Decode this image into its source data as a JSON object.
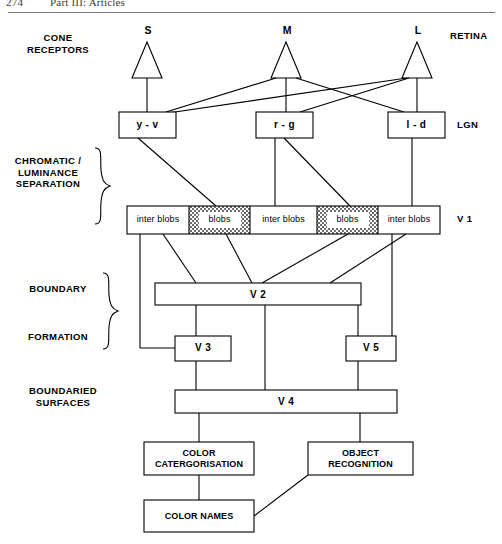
{
  "page": {
    "folio": "274",
    "running_title": "Part III: Articles"
  },
  "side_labels": {
    "cone_receptors": "CONE\nRECEPTORS",
    "chromatic_luminance": "CHROMATIC /\nLUMINANCE\nSEPARATION",
    "boundary": "BOUNDARY",
    "formation": "FORMATION",
    "boundaried_surfaces": "BOUNDARIED\nSURFACES"
  },
  "right_labels": {
    "retina": "RETINA",
    "lgn": "LGN",
    "v1": "V 1"
  },
  "cones": [
    {
      "name": "cone-s",
      "label": "S",
      "x": 147
    },
    {
      "name": "cone-m",
      "label": "M",
      "x": 286
    },
    {
      "name": "cone-l",
      "label": "L",
      "x": 417
    }
  ],
  "lgn_boxes": [
    {
      "name": "lgn-box-yv",
      "label": "y - v",
      "x": 119,
      "y": 112,
      "w": 57,
      "h": 26
    },
    {
      "name": "lgn-box-rg",
      "label": "r - g",
      "x": 256,
      "y": 112,
      "w": 57,
      "h": 26
    },
    {
      "name": "lgn-box-ld",
      "label": "l - d",
      "x": 388,
      "y": 112,
      "w": 57,
      "h": 26
    }
  ],
  "v1_strip": {
    "x": 127,
    "y": 206,
    "w": 313,
    "h": 28,
    "segments": [
      {
        "name": "v1-inter-blobs-1",
        "label": "inter blobs",
        "type": "inter",
        "w": 62
      },
      {
        "name": "v1-blobs-1",
        "label": "blobs",
        "type": "blob",
        "w": 61
      },
      {
        "name": "v1-inter-blobs-2",
        "label": "inter blobs",
        "type": "inter",
        "w": 67
      },
      {
        "name": "v1-blobs-2",
        "label": "blobs",
        "type": "blob",
        "w": 61
      },
      {
        "name": "v1-inter-blobs-3",
        "label": "inter blobs",
        "type": "inter",
        "w": 62
      }
    ]
  },
  "area_boxes": [
    {
      "name": "box-v2",
      "label": "V 2",
      "x": 155,
      "y": 283,
      "w": 206,
      "h": 22
    },
    {
      "name": "box-v3",
      "label": "V 3",
      "x": 175,
      "y": 336,
      "w": 56,
      "h": 25
    },
    {
      "name": "box-v5",
      "label": "V 5",
      "x": 346,
      "y": 336,
      "w": 50,
      "h": 25
    },
    {
      "name": "box-v4",
      "label": "V 4",
      "x": 175,
      "y": 390,
      "w": 222,
      "h": 23
    },
    {
      "name": "box-color-categorisation",
      "label": "COLOR\nCATERGORISATION",
      "x": 144,
      "y": 442,
      "w": 110,
      "h": 33
    },
    {
      "name": "box-object-recognition",
      "label": "OBJECT\nRECOGNITION",
      "x": 308,
      "y": 442,
      "w": 105,
      "h": 33
    },
    {
      "name": "box-color-names",
      "label": "COLOR NAMES",
      "x": 144,
      "y": 500,
      "w": 110,
      "h": 32
    }
  ],
  "colors": {
    "ink": "#000000",
    "rule": "#7b7b7b",
    "blob_fill": "#6e6e6e",
    "paper": "#ffffff"
  }
}
